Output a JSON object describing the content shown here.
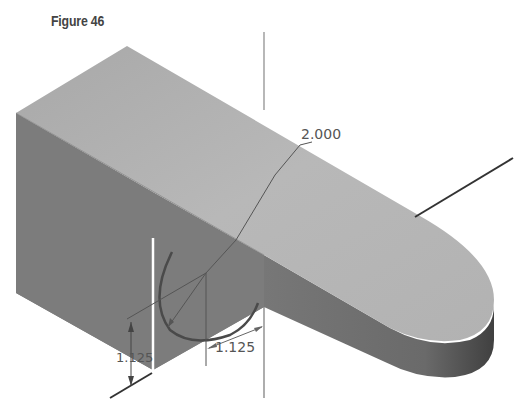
{
  "figure": {
    "title": "Figure 46"
  },
  "dimensions": {
    "radius_label": "2.000",
    "horizontal_offset_label": "1.125",
    "vertical_offset_label": "1.125"
  },
  "colors": {
    "top_face": "#b4b4b4",
    "left_face": "#7e7e7e",
    "arm_side": "#6e6e6e",
    "arm_end": "#4a4a4a",
    "axis_line": "#333333",
    "dimension_line": "#555555",
    "sketch_arc": "#4a4a4a",
    "background": "#ffffff"
  }
}
